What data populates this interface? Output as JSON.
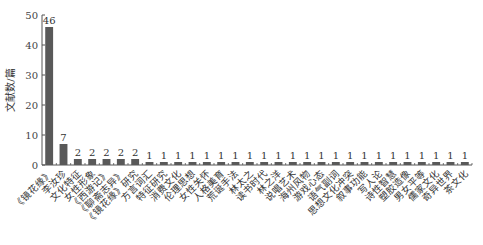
{
  "chart_data": {
    "type": "bar",
    "title": "",
    "xlabel": "",
    "ylabel": "文献数/篇",
    "ylim": [
      0,
      50
    ],
    "yticks": [
      0,
      10,
      20,
      30,
      40,
      50
    ],
    "grid": false,
    "legend": null,
    "bar_color": "#595959",
    "categories": [
      "《镜花缘》",
      "李汝珍",
      "文化特征",
      "女性形象",
      "《西游记》",
      "《聊斋志异》",
      "《镜花缘》研究",
      "方言词汇",
      "特征研究",
      "消费文化",
      "伦理思想",
      "女性关怀",
      "人格美育",
      "荒诞手法",
      "林太之",
      "读书时代",
      "林之洋",
      "说唱艺术",
      "海州风物",
      "游戏心态",
      "语气副词",
      "思想文化冲突",
      "叙事功能",
      "写人论",
      "诗性智慧",
      "塑胶造像",
      "男女平等",
      "儒家文化",
      "奇异世界",
      "茶文化"
    ],
    "values": [
      46,
      7,
      2,
      2,
      2,
      2,
      2,
      1,
      1,
      1,
      1,
      1,
      1,
      1,
      1,
      1,
      1,
      1,
      1,
      1,
      1,
      1,
      1,
      1,
      1,
      1,
      1,
      1,
      1,
      1
    ]
  }
}
